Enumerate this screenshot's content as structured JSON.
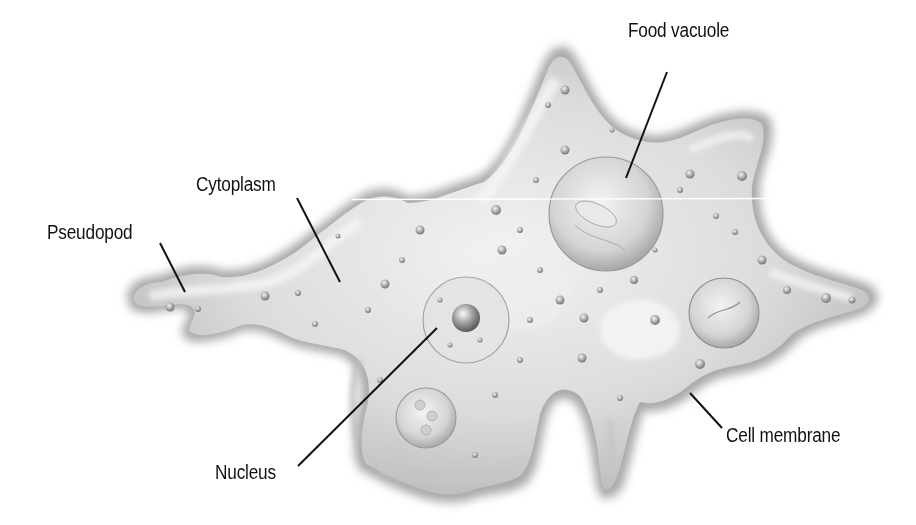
{
  "diagram": {
    "colors": {
      "body_fill": "#d6d6d6",
      "body_edge": "#9a9a9a",
      "highlight": "#f4f4f4",
      "leader_line": "#111111",
      "label_text": "#111111",
      "background": "#ffffff"
    },
    "labels": [
      {
        "id": "food-vacuole",
        "text": "Food vacuole",
        "x": 628,
        "y": 20
      },
      {
        "id": "cytoplasm",
        "text": "Cytoplasm",
        "x": 196,
        "y": 174
      },
      {
        "id": "pseudopod",
        "text": "Pseudopod",
        "x": 47,
        "y": 222
      },
      {
        "id": "nucleus",
        "text": "Nucleus",
        "x": 215,
        "y": 462
      },
      {
        "id": "cell-membrane",
        "text": "Cell membrane",
        "x": 726,
        "y": 425
      }
    ],
    "leaders": [
      {
        "id": "food-vacuole",
        "x1": 667,
        "y1": 72,
        "x2": 626,
        "y2": 178
      },
      {
        "id": "cytoplasm",
        "x1": 297,
        "y1": 198,
        "x2": 340,
        "y2": 282
      },
      {
        "id": "pseudopod",
        "x1": 160,
        "y1": 243,
        "x2": 185,
        "y2": 292
      },
      {
        "id": "nucleus",
        "x1": 298,
        "y1": 466,
        "x2": 437,
        "y2": 328
      },
      {
        "id": "cell-membrane",
        "x1": 690,
        "y1": 393,
        "x2": 722,
        "y2": 428
      }
    ]
  }
}
